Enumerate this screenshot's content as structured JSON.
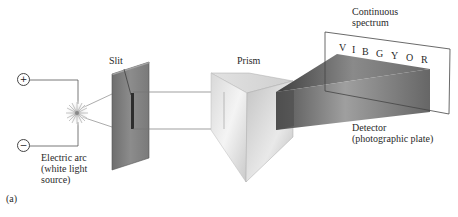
{
  "labels": {
    "slit": "Slit",
    "prism": "Prism",
    "spectrum_line1": "Continuous",
    "spectrum_line2": "spectrum",
    "detector_line1": "Detector",
    "detector_line2": "(photographic plate)",
    "arc_line1": "Electric arc",
    "arc_line2": "(white light",
    "arc_line3": "source)",
    "panel": "(a)"
  },
  "terminals": {
    "positive": "+",
    "negative": "−"
  },
  "spectrum_letters": [
    "V",
    "I",
    "B",
    "G",
    "Y",
    "O",
    "R"
  ],
  "colors": {
    "line": "#555555",
    "slit_plate": "#7d7d7d",
    "prism_light": "#e6e6e6",
    "beam_dark": "#5a5a5a"
  }
}
